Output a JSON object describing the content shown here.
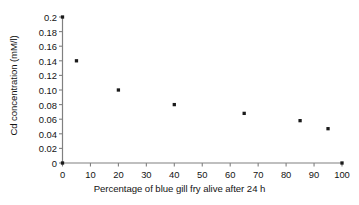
{
  "chart_data": {
    "type": "scatter",
    "title": "",
    "xlabel": "Percentage of blue gill fry alive after 24 h",
    "ylabel": "Cd concentration (mM/l)",
    "xlim": [
      0,
      100
    ],
    "ylim": [
      0,
      0.2
    ],
    "grid": false,
    "legend": null,
    "x_ticks": [
      0,
      10,
      20,
      30,
      40,
      50,
      60,
      70,
      80,
      90,
      100
    ],
    "x_tick_labels": [
      "0",
      "10",
      "20",
      "30",
      "40",
      "50",
      "60",
      "70",
      "80",
      "90",
      "100"
    ],
    "y_ticks": [
      0,
      0.02,
      0.04,
      0.06,
      0.08,
      0.1,
      0.12,
      0.14,
      0.16,
      0.18,
      0.2
    ],
    "y_tick_labels": [
      "0",
      "0.02",
      "0.04",
      "0.06",
      "0.08",
      "0.10",
      "0.12",
      "0.14",
      "0.16",
      "0.18",
      "0.2"
    ],
    "marker": "square",
    "marker_color": "#1a1a1a",
    "axis_color": "#808080",
    "series": [
      {
        "name": "Cd concentration vs survival",
        "points": [
          {
            "x": 0,
            "y": 0.2
          },
          {
            "x": 0,
            "y": 0.0
          },
          {
            "x": 5,
            "y": 0.14
          },
          {
            "x": 20,
            "y": 0.1
          },
          {
            "x": 40,
            "y": 0.08
          },
          {
            "x": 65,
            "y": 0.068
          },
          {
            "x": 85,
            "y": 0.058
          },
          {
            "x": 95,
            "y": 0.047
          },
          {
            "x": 100,
            "y": 0.0
          }
        ]
      }
    ]
  }
}
